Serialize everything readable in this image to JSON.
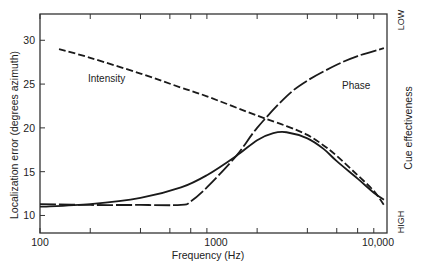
{
  "chart_data": {
    "type": "line",
    "title": "",
    "xlabel": "Frequency (Hz)",
    "ylabel": "Localization error (degrees azimuth)",
    "ylabel_right": "Cue effectiveness",
    "right_axis_ticks": {
      "top": "LOW",
      "bottom": "HIGH"
    },
    "xscale": "log",
    "xlim": [
      100,
      12000
    ],
    "ylim": [
      8,
      33
    ],
    "x_tick_labels": [
      "100",
      "1000",
      "10,000"
    ],
    "x_ticks": [
      100,
      200,
      400,
      600,
      800,
      1000,
      2000,
      4000,
      6000,
      8000,
      10000
    ],
    "y_ticks": [
      10,
      15,
      20,
      25,
      30
    ],
    "grid": false,
    "series": [
      {
        "name": "Localization error",
        "style": "solid",
        "x": [
          100,
          200,
          400,
          700,
          1000,
          1500,
          2000,
          2500,
          3000,
          4000,
          5000,
          6000,
          8000,
          10000,
          11500
        ],
        "y": [
          11.0,
          11.3,
          12.0,
          13.2,
          14.6,
          16.8,
          18.6,
          19.4,
          19.5,
          18.8,
          17.6,
          16.2,
          14.2,
          12.6,
          11.8
        ]
      },
      {
        "name": "Intensity",
        "style": "dashed",
        "label": "Intensity",
        "x": [
          130,
          200,
          400,
          700,
          1000,
          2000,
          3000,
          4000,
          5000,
          6000,
          8000,
          10000,
          11500
        ],
        "y": [
          29.0,
          28.0,
          26.2,
          24.6,
          23.6,
          21.4,
          20.2,
          19.2,
          18.0,
          16.8,
          14.6,
          12.8,
          11.2
        ]
      },
      {
        "name": "Phase",
        "style": "long-dash",
        "label": "Phase",
        "x": [
          100,
          200,
          400,
          700,
          800,
          1000,
          1500,
          2000,
          3000,
          4000,
          6000,
          8000,
          11500
        ],
        "y": [
          11.3,
          11.2,
          11.2,
          11.2,
          11.6,
          13.2,
          16.8,
          20.0,
          23.6,
          25.4,
          27.2,
          28.2,
          29.1
        ]
      }
    ],
    "annotations": [
      {
        "text": "Intensity",
        "x": 250,
        "y": 26.5
      },
      {
        "text": "Phase",
        "x": 4200,
        "y": 22.8
      }
    ]
  }
}
